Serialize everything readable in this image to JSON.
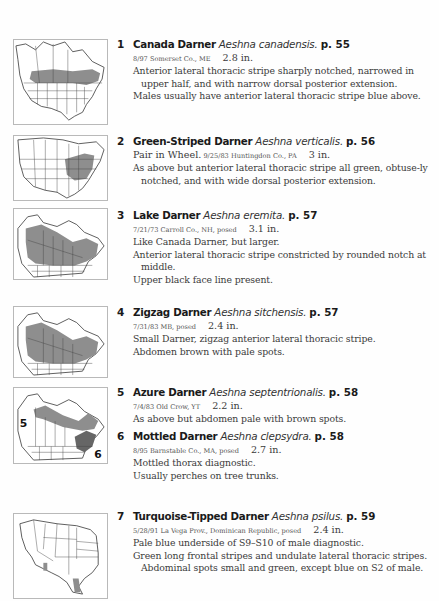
{
  "entries": [
    {
      "number": "1",
      "common_name": "Canada Darner",
      "scientific_name": "Aeshna canadensis.",
      "page_ref": "p. 55",
      "meta_lead": "",
      "photo_info": "8/97 Somerset Co., ME",
      "size": "2.8 in.",
      "notes": [
        "Anterior lateral thoracic stripe sharply notched, narrowed in upper half, and with narrow dorsal posterior extension.",
        "Males usually have anterior lateral thoracic stripe blue above."
      ],
      "map": {
        "region": "North America",
        "range": "southern Canada / northern US band"
      }
    },
    {
      "number": "2",
      "common_name": "Green-Striped Darner",
      "scientific_name": "Aeshna verticalis.",
      "page_ref": "p. 56",
      "meta_lead": "Pair in Wheel.",
      "photo_info": "9/25/83 Huntingdon Co., PA",
      "size": "3 in.",
      "notes": [
        "As above but anterior lateral thoracic stripe all green, obtuse-ly notched, and with wide dorsal posterior extension."
      ],
      "map": {
        "region": "North America",
        "range": "northeastern US"
      }
    },
    {
      "number": "3",
      "common_name": "Lake Darner",
      "scientific_name": "Aeshna eremita.",
      "page_ref": "p. 57",
      "meta_lead": "",
      "photo_info": "7/21/73 Carroll Co., NH, posed",
      "size": "3.1 in.",
      "notes": [
        "Like Canada Darner, but larger.",
        "Anterior lateral thoracic stripe constricted by rounded notch at middle.",
        "Upper black face line present."
      ],
      "map": {
        "region": "Canada",
        "range": "boreal Canada"
      }
    },
    {
      "number": "4",
      "common_name": "Zigzag Darner",
      "scientific_name": "Aeshna sitchensis.",
      "page_ref": "p. 57",
      "meta_lead": "",
      "photo_info": "7/31/83 MB, posed",
      "size": "2.4 in.",
      "notes": [
        "Small Darner, zigzag anterior lateral thoracic stripe.",
        "Abdomen brown with pale spots."
      ],
      "map": {
        "region": "Canada",
        "range": "boreal Canada"
      }
    },
    {
      "number": "5",
      "common_name": "Azure Darner",
      "scientific_name": "Aeshna septentrionalis.",
      "page_ref": "p. 58",
      "meta_lead": "",
      "photo_info": "7/4/83 Old Crow, YT",
      "size": "2.2 in.",
      "notes": [
        "As above but abdomen pale with brown spots."
      ],
      "map": {
        "region": "Canada",
        "range": "subarctic Canada",
        "label": "5"
      }
    },
    {
      "number": "6",
      "common_name": "Mottled Darner",
      "scientific_name": "Aeshna clepsydra.",
      "page_ref": "p. 58",
      "meta_lead": "",
      "photo_info": "8/95 Barnstable Co., MA, posed",
      "size": "2.7 in.",
      "notes": [
        "Mottled thorax diagnostic.",
        "Usually perches on tree trunks."
      ],
      "map": {
        "region": "Canada",
        "range": "northeastern US",
        "label": "6"
      }
    },
    {
      "number": "7",
      "common_name": "Turquoise-Tipped Darner",
      "scientific_name": "Aeshna psilus.",
      "page_ref": "p. 59",
      "meta_lead": "",
      "photo_info": "5/28/91 La Vega Prov., Dominican Republic, posed",
      "size": "2.4 in.",
      "notes": [
        "Pale blue underside of S9–S10 of male diagnostic.",
        "Green long frontal stripes and undulate lateral thoracic stripes. Abdominal spots small and green, except blue on S2 of male."
      ],
      "map": {
        "region": "Southwestern US",
        "range": "southern Arizona and south Texas"
      }
    }
  ],
  "colors": {
    "range_fill": "#8e8e8e",
    "map_border": "#b9b9b9",
    "text": "#3a3a3a",
    "heading": "#1a1a1a"
  }
}
